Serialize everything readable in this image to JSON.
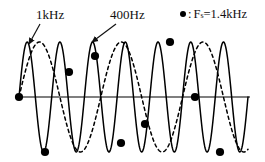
{
  "figure": {
    "background": "#ffffff"
  },
  "labels": {
    "signal_label": "1kHz",
    "alias_label": "400Hz"
  },
  "legend": {
    "marker_symbol": "●",
    "colon": ":",
    "variable": "F",
    "subscript": "s",
    "equals_value": "=1.4kHz",
    "full_text": "● : F_s=1.4kHz"
  },
  "colors": {
    "signal_stroke": "#000000",
    "alias_stroke": "#000000",
    "axis_stroke": "#555555",
    "sample_fill": "#000000",
    "text": "#111111"
  },
  "chart_data": {
    "type": "line",
    "xlabel": "",
    "ylabel": "",
    "grid": false,
    "legend_position": "top-right",
    "axis": {
      "zero_line_y": 97,
      "x_start": 15,
      "x_end": 250
    },
    "series": [
      {
        "name": "1kHz",
        "style": "solid",
        "frequency_hz": 1000,
        "cycles_drawn": 7,
        "amplitude_px": 55,
        "phase": 0,
        "x_start": 19,
        "x_end": 248
      },
      {
        "name": "400Hz",
        "style": "dashed",
        "frequency_hz": 400,
        "cycles_drawn": 2.8,
        "amplitude_px": 55,
        "phase": 0,
        "x_start": 19,
        "x_end": 248
      }
    ],
    "samples": {
      "name": "Fs=1.4kHz samples",
      "sample_rate_hz": 1400,
      "marker": "filled-circle",
      "points": [
        {
          "x": 19,
          "y": 97,
          "value": 0.0
        },
        {
          "x": 45,
          "y": 152,
          "value": -0.97
        },
        {
          "x": 69,
          "y": 72,
          "value": 0.45
        },
        {
          "x": 95,
          "y": 56,
          "value": 0.75
        },
        {
          "x": 121,
          "y": 143,
          "value": -0.83
        },
        {
          "x": 145,
          "y": 124,
          "value": -0.49
        },
        {
          "x": 170,
          "y": 42,
          "value": 1.0
        },
        {
          "x": 195,
          "y": 97,
          "value": 0.0
        },
        {
          "x": 220,
          "y": 152,
          "value": -0.97
        }
      ]
    },
    "annotations": [
      {
        "text": "1kHz",
        "label_x": 36,
        "label_y": 8,
        "arrow_from": [
          40,
          24
        ],
        "arrow_to": [
          29,
          44
        ]
      },
      {
        "text": "400Hz",
        "label_x": 110,
        "label_y": 8,
        "arrow_from": [
          116,
          24
        ],
        "arrow_to": [
          92,
          42
        ]
      }
    ]
  }
}
